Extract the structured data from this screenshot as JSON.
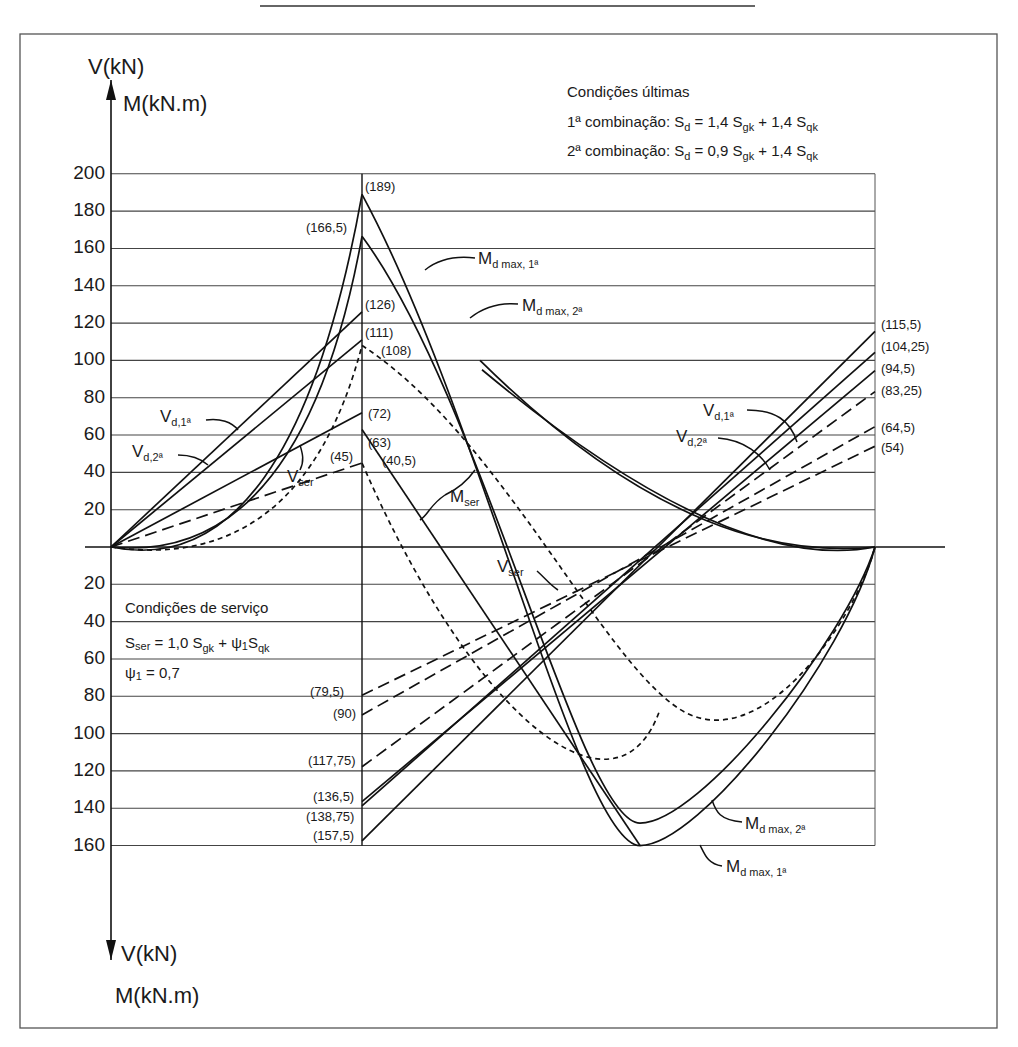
{
  "chart_data": {
    "type": "line",
    "axes": {
      "y_top_label_1": "V(kN)",
      "y_top_label_2": "M(kN.m)",
      "y_bottom_label_1": "V(kN)",
      "y_bottom_label_2": "M(kN.m)",
      "positive_ticks": [
        "200",
        "180",
        "160",
        "140",
        "120",
        "100",
        "80",
        "60",
        "40",
        "20"
      ],
      "negative_ticks": [
        "20",
        "40",
        "60",
        "80",
        "100",
        "120",
        "140",
        "160"
      ],
      "ylim": [
        -160,
        200
      ],
      "grid": true,
      "x_supports": [
        0,
        1,
        2.4
      ]
    },
    "annotations": {
      "ultimate_title": "Condições últimas",
      "comb1_prefix": "1ª combinação: S",
      "comb1_sub_d": "d",
      "comb1_mid": " = 1,4 S",
      "comb1_sub_gk": "gk",
      "comb1_plus": " + 1,4 S",
      "comb1_sub_qk": "qk",
      "comb2_prefix": "2ª combinação: S",
      "comb2_sub_d": "d",
      "comb2_mid": " = 0,9 S",
      "comb2_sub_gk": "gk",
      "comb2_plus": " + 1,4 S",
      "comb2_sub_qk": "qk",
      "service_title": "Condições de serviço",
      "service_formula_S": "S",
      "service_formula_ser": "ser",
      "service_formula_rest": " = 1,0 S",
      "service_formula_gk": "gk",
      "service_formula_plus": " + ψ",
      "service_formula_1": "1",
      "service_formula_S2": "S",
      "service_formula_qk": "qk",
      "psi_line": "ψ",
      "psi_sub": "1",
      "psi_value": " = 0,7"
    },
    "curve_labels": {
      "Md1_top": {
        "main": "M",
        "sub": "d max, 1ª"
      },
      "Md2_top": {
        "main": "M",
        "sub": "d max, 2ª"
      },
      "Md2_bottom": {
        "main": "M",
        "sub": "d max, 2ª"
      },
      "Md1_bottom": {
        "main": "M",
        "sub": "d max, 1ª"
      },
      "Vd1_left": {
        "main": "V",
        "sub": "d,1ª"
      },
      "Vd2_left": {
        "main": "V",
        "sub": "d,2ª"
      },
      "Vser_left": {
        "main": "V",
        "sub": "ser"
      },
      "Mser": {
        "main": "M",
        "sub": "ser"
      },
      "Vd1_right": {
        "main": "V",
        "sub": "d,1ª"
      },
      "Vd2_right": {
        "main": "V",
        "sub": "d,2ª"
      },
      "Vser_right": {
        "main": "V",
        "sub": "ser"
      }
    },
    "value_labels": {
      "m189": "(189)",
      "m166_5": "(166,5)",
      "v126": "(126)",
      "v111": "(111)",
      "m108": "(108)",
      "v72": "(72)",
      "v63": "(63)",
      "m45": "(45)",
      "v40_5": "(40,5)",
      "r115_5": "(115,5)",
      "r104_25": "(104,25)",
      "r94_5": "(94,5)",
      "r83_25": "(83,25)",
      "r64_5": "(64,5)",
      "r54": "(54)",
      "n79_5": "(79,5)",
      "n90": "(90)",
      "n117_75": "(117,75)",
      "n136_5": "(136,5)",
      "n138_75": "(138,75)",
      "n157_5": "(157,5)"
    },
    "series": [
      {
        "name": "M d max, 1ª (span 1)",
        "style": "solid",
        "points": [
          [
            0,
            0
          ],
          [
            0.25,
            -20
          ],
          [
            0.5,
            -60
          ],
          [
            0.75,
            -115
          ],
          [
            1,
            -189
          ]
        ],
        "note": "hogging over support plotted upward"
      },
      {
        "name": "M d max, 1ª (span 2)",
        "style": "solid",
        "from": 189,
        "min": -160
      },
      {
        "name": "M d max, 2ª (span 2)",
        "style": "solid",
        "from": 166.5,
        "min": -147
      },
      {
        "name": "M ser",
        "style": "dotted",
        "from": 108,
        "min": -87
      },
      {
        "name": "V d,1ª",
        "style": "solid",
        "span1": [
          0,
          126
        ],
        "span2": [
          -157.5,
          115.5
        ]
      },
      {
        "name": "V d,1ª alt",
        "style": "solid",
        "span1": [
          0,
          111
        ],
        "span2": [
          -136.5,
          104.25
        ]
      },
      {
        "name": "V d,2ª",
        "style": "solid",
        "span1": [
          0,
          72
        ],
        "span2": [
          -138.75,
          94.5
        ],
        "span2b": [
          -117.75,
          83.25
        ]
      },
      {
        "name": "V ser",
        "style": "dashed",
        "span1": [
          0,
          45
        ],
        "span2": [
          -90,
          64.5
        ],
        "span2b": [
          -79.5,
          54
        ]
      }
    ]
  }
}
